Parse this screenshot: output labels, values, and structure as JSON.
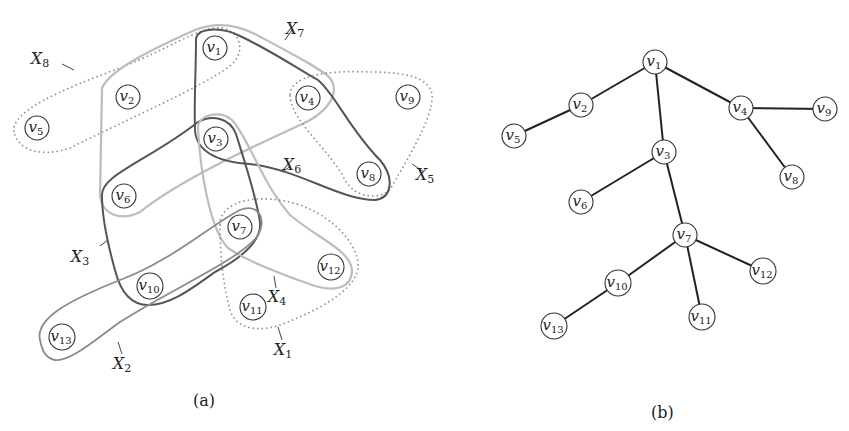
{
  "figure": {
    "panel_a": {
      "caption": "(a)",
      "type": "hypergraph",
      "nodes": [
        {
          "id": "v1",
          "base": "v",
          "sub": "1",
          "x": 215,
          "y": 48
        },
        {
          "id": "v2",
          "base": "v",
          "sub": "2",
          "x": 128,
          "y": 97
        },
        {
          "id": "v3",
          "base": "v",
          "sub": "3",
          "x": 216,
          "y": 139
        },
        {
          "id": "v4",
          "base": "v",
          "sub": "4",
          "x": 308,
          "y": 98
        },
        {
          "id": "v5",
          "base": "v",
          "sub": "5",
          "x": 37,
          "y": 128
        },
        {
          "id": "v6",
          "base": "v",
          "sub": "6",
          "x": 124,
          "y": 196
        },
        {
          "id": "v7",
          "base": "v",
          "sub": "7",
          "x": 240,
          "y": 227
        },
        {
          "id": "v8",
          "base": "v",
          "sub": "8",
          "x": 369,
          "y": 174
        },
        {
          "id": "v9",
          "base": "v",
          "sub": "9",
          "x": 408,
          "y": 97
        },
        {
          "id": "v10",
          "base": "v",
          "sub": "10",
          "x": 150,
          "y": 286
        },
        {
          "id": "v11",
          "base": "v",
          "sub": "11",
          "x": 253,
          "y": 307
        },
        {
          "id": "v12",
          "base": "v",
          "sub": "12",
          "x": 331,
          "y": 267
        },
        {
          "id": "v13",
          "base": "v",
          "sub": "13",
          "x": 62,
          "y": 337
        }
      ],
      "hyperedges": [
        {
          "id": "X1",
          "base": "X",
          "sub": "1",
          "members": [
            "v7",
            "v11",
            "v12"
          ],
          "style": "dotted",
          "label_x": 283,
          "label_y": 355
        },
        {
          "id": "X2",
          "base": "X",
          "sub": "2",
          "members": [
            "v13",
            "v10",
            "v7"
          ],
          "style": "mid",
          "label_x": 122,
          "label_y": 369
        },
        {
          "id": "X3",
          "base": "X",
          "sub": "3",
          "members": [
            "v3",
            "v6",
            "v10",
            "v7"
          ],
          "style": "dark",
          "label_x": 80,
          "label_y": 262
        },
        {
          "id": "X4",
          "base": "X",
          "sub": "4",
          "members": [
            "v3",
            "v7",
            "v12"
          ],
          "style": "light",
          "label_x": 277,
          "label_y": 302
        },
        {
          "id": "X5",
          "base": "X",
          "sub": "5",
          "members": [
            "v4",
            "v8",
            "v9"
          ],
          "style": "dotted",
          "label_x": 425,
          "label_y": 180
        },
        {
          "id": "X6",
          "base": "X",
          "sub": "6",
          "members": [
            "v1",
            "v3",
            "v4",
            "v8"
          ],
          "style": "dark",
          "label_x": 292,
          "label_y": 170
        },
        {
          "id": "X7",
          "base": "X",
          "sub": "7",
          "members": [
            "v1",
            "v2",
            "v4",
            "v6"
          ],
          "style": "light",
          "label_x": 295,
          "label_y": 34
        },
        {
          "id": "X8",
          "base": "X",
          "sub": "8",
          "members": [
            "v1",
            "v2",
            "v5"
          ],
          "style": "dotted",
          "label_x": 40,
          "label_y": 64
        }
      ]
    },
    "panel_b": {
      "caption": "(b)",
      "type": "tree",
      "nodes": [
        {
          "id": "v1",
          "base": "v",
          "sub": "1",
          "x": 655,
          "y": 62
        },
        {
          "id": "v2",
          "base": "v",
          "sub": "2",
          "x": 581,
          "y": 105
        },
        {
          "id": "v3",
          "base": "v",
          "sub": "3",
          "x": 664,
          "y": 152
        },
        {
          "id": "v4",
          "base": "v",
          "sub": "4",
          "x": 741,
          "y": 108
        },
        {
          "id": "v5",
          "base": "v",
          "sub": "5",
          "x": 514,
          "y": 136
        },
        {
          "id": "v6",
          "base": "v",
          "sub": "6",
          "x": 581,
          "y": 202
        },
        {
          "id": "v7",
          "base": "v",
          "sub": "7",
          "x": 685,
          "y": 235
        },
        {
          "id": "v8",
          "base": "v",
          "sub": "8",
          "x": 792,
          "y": 177
        },
        {
          "id": "v9",
          "base": "v",
          "sub": "9",
          "x": 825,
          "y": 109
        },
        {
          "id": "v10",
          "base": "v",
          "sub": "10",
          "x": 618,
          "y": 283
        },
        {
          "id": "v11",
          "base": "v",
          "sub": "11",
          "x": 702,
          "y": 317
        },
        {
          "id": "v12",
          "base": "v",
          "sub": "12",
          "x": 763,
          "y": 271
        },
        {
          "id": "v13",
          "base": "v",
          "sub": "13",
          "x": 554,
          "y": 326
        }
      ],
      "edges": [
        [
          "v1",
          "v2"
        ],
        [
          "v2",
          "v5"
        ],
        [
          "v1",
          "v3"
        ],
        [
          "v1",
          "v4"
        ],
        [
          "v4",
          "v9"
        ],
        [
          "v4",
          "v8"
        ],
        [
          "v3",
          "v6"
        ],
        [
          "v3",
          "v7"
        ],
        [
          "v7",
          "v10"
        ],
        [
          "v7",
          "v11"
        ],
        [
          "v7",
          "v12"
        ],
        [
          "v10",
          "v13"
        ]
      ]
    }
  },
  "colors": {
    "tree_edge": "#222222",
    "hyperedge_dark": "#555555",
    "hyperedge_mid": "#8a8a8a",
    "hyperedge_light": "#bdbdbd",
    "hyperedge_dotted": "#8c8c8c"
  }
}
